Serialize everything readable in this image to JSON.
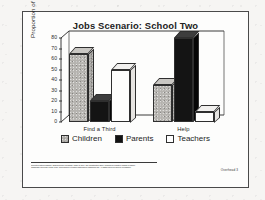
{
  "chart_data": {
    "type": "bar",
    "title": "Jobs Scenario:  School Two",
    "xlabel": "",
    "ylabel": "Proportion of Subjects",
    "categories": [
      "Find a Third",
      "Help"
    ],
    "series": [
      {
        "name": "Children",
        "values": [
          65,
          35
        ],
        "color": "#b4b2ae"
      },
      {
        "name": "Parents",
        "values": [
          20,
          80
        ],
        "color": "#121212"
      },
      {
        "name": "Teachers",
        "values": [
          50,
          10
        ],
        "color": "#fefefe"
      }
    ],
    "ylim": [
      0,
      80
    ],
    "yticks": [
      0,
      10,
      20,
      30,
      40,
      50,
      60,
      70,
      80
    ],
    "ytick_labels": [
      "0",
      "10",
      "20",
      "30",
      "40",
      "50",
      "60",
      "70",
      "80"
    ],
    "grid": false,
    "legend_position": "bottom",
    "style": "3d-grouped-bars"
  },
  "footer": {
    "citation_lines": [
      "Reprinted with permission. Original source: Newman, Griffin, & Cole, The Construction Zone: Working for cognitive change in school.",
      "Cambridge University Press, 1989. Reproduced in teacher materials for classroom use. All rights reserved; used by permission."
    ],
    "overhead_label": "Overhead 3"
  }
}
